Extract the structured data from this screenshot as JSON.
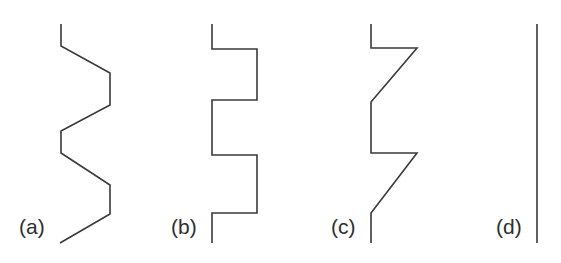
{
  "figure": {
    "width": 561,
    "height": 263,
    "background_color": "#ffffff",
    "stroke_color": "#3a3a3a",
    "stroke_width": 1.6,
    "panels": [
      {
        "id": "a",
        "label": "(a)",
        "label_x": 19,
        "label_y": 216,
        "shape": "zigzag with diagonal transitions",
        "points": "61,24 61,46 110,73 110,105 61,131 61,153 110,185 110,214 60,243"
      },
      {
        "id": "b",
        "label": "(b)",
        "label_x": 171,
        "label_y": 216,
        "shape": "square wave with right-angle transitions",
        "points": "212,24 212,49 257,49 257,100 212,100 212,155 257,155 257,213 212,213 212,243"
      },
      {
        "id": "c",
        "label": "(c)",
        "label_x": 331,
        "label_y": 216,
        "shape": "sawtooth mixing right angles and diagonals",
        "points": "371,24 371,48 417,48 371,102 371,153 417,153 371,213 371,243"
      },
      {
        "id": "d",
        "label": "(d)",
        "label_x": 496,
        "label_y": 216,
        "shape": "straight vertical line",
        "points": "537,24 537,243"
      }
    ]
  }
}
